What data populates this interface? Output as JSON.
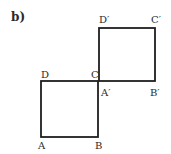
{
  "figure": {
    "part_label": "b)",
    "stroke_color": "#1e1e1e",
    "squares": [
      {
        "name": "ABCD",
        "vertices": {
          "A": [
            41,
            137
          ],
          "B": [
            98,
            137
          ],
          "C": [
            98,
            81
          ],
          "D": [
            41,
            81
          ]
        }
      },
      {
        "name": "A'B'C'D'",
        "vertices": {
          "A'": [
            99,
            81
          ],
          "B'": [
            155,
            81
          ],
          "C'": [
            155,
            28
          ],
          "D'": [
            99,
            28
          ]
        }
      }
    ],
    "labels": {
      "A": "A",
      "B": "B",
      "C": "C",
      "D": "D",
      "A_prime": "A′",
      "B_prime": "B′",
      "C_prime": "C′",
      "D_prime": "D′"
    }
  }
}
